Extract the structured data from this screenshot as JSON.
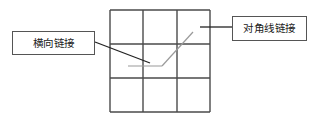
{
  "figure": {
    "type": "grid-annotation-diagram",
    "background_color": "#ffffff",
    "grid": {
      "name": "3x3-grid",
      "rows": 3,
      "columns": 3,
      "stroke_color": "#4a4a4a",
      "stroke_width": 1.4,
      "bounds": {
        "x": 110,
        "y": 10,
        "width": 100,
        "height": 102
      },
      "vertical_lines_x": [
        110,
        143,
        177,
        210
      ],
      "horizontal_lines_y": [
        10,
        44,
        78,
        112
      ]
    },
    "links": [
      {
        "name": "horizontal-link-segment",
        "kind": "horizontal",
        "color": "#9a9a9a",
        "stroke_width": 1.2,
        "x1": 128,
        "y1": 66,
        "x2": 162,
        "y2": 66
      },
      {
        "name": "diagonal-link-segment",
        "kind": "diagonal",
        "color": "#9a9a9a",
        "stroke_width": 1.2,
        "x1": 162,
        "y1": 66,
        "x2": 193,
        "y2": 32
      }
    ],
    "leaders": [
      {
        "name": "leader-line-horizontal-label",
        "color": "#222222",
        "stroke_width": 1.3,
        "x1": 95,
        "y1": 42,
        "x2": 150,
        "y2": 63
      },
      {
        "name": "leader-line-diagonal-label",
        "color": "#222222",
        "stroke_width": 1.3,
        "x1": 200,
        "y1": 27,
        "x2": 232,
        "y2": 27
      }
    ]
  },
  "labels": {
    "horizontal_link": {
      "text": "横向链接",
      "border_color": "#555555",
      "text_color": "#202020"
    },
    "diagonal_link": {
      "text": "对角线链接",
      "border_color": "#555555",
      "text_color": "#202020"
    }
  }
}
